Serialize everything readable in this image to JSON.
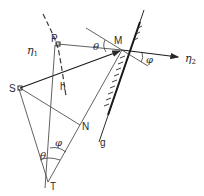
{
  "diagram": {
    "points": {
      "P": "P",
      "M": "M",
      "S": "S",
      "N": "N",
      "T": "T"
    },
    "curves": {
      "h": "h",
      "g": "g"
    },
    "media": {
      "eta1": "η",
      "eta1_sub": "1",
      "eta2": "η",
      "eta2_sub": "2"
    },
    "angles": {
      "theta_at_M": "θ",
      "phi_at_M": "φ",
      "theta_at_T": "θ",
      "phi_at_T": "φ"
    },
    "colors": {
      "line": "#3a3a3a",
      "background": "#ffffff"
    }
  }
}
